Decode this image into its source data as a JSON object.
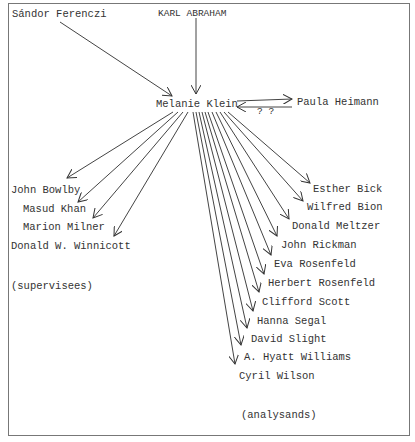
{
  "diagram": {
    "center": "Melanie Klein",
    "influences": [
      "Sándor Ferenczi",
      "KARL ABRAHAM"
    ],
    "peer": {
      "name": "Paula Heimann",
      "uncertain_mark": "? ?"
    },
    "supervisees": [
      "John Bowlby",
      "Masud Khan",
      "Marion Milner",
      "Donald W. Winnicott"
    ],
    "supervisees_caption": "(supervisees)",
    "analysands": [
      "Esther Bick",
      "Wilfred Bion",
      "Donald Meltzer",
      "John Rickman",
      "Eva Rosenfeld",
      "Herbert Rosenfeld",
      "Clifford Scott",
      "Hanna Segal",
      "David Slight",
      "A. Hyatt Williams",
      "Cyril Wilson"
    ],
    "analysands_caption": "(analysands)"
  }
}
